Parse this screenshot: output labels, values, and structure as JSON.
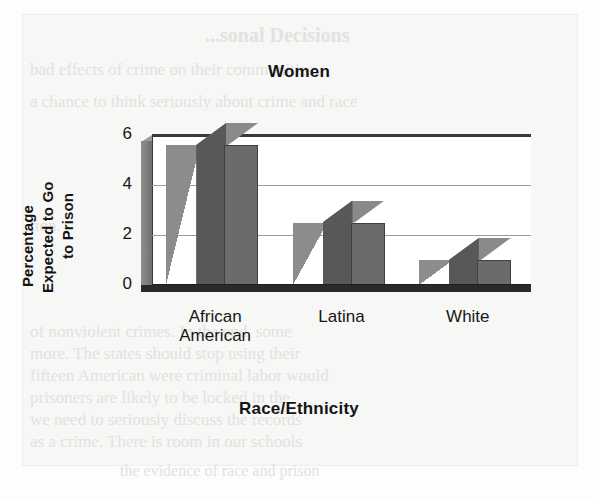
{
  "page": {
    "background_color": "#fdfdfd",
    "panel_color": "#f7f7f5",
    "ghost_lines": [
      {
        "text": "...sonal Decisions",
        "x": 205,
        "y": 24,
        "size": 20,
        "bold": true
      },
      {
        "text": "bad effects of crime on their communities",
        "x": 30,
        "y": 60,
        "size": 17,
        "bold": false
      },
      {
        "text": "a chance to think seriously about crime and race",
        "x": 30,
        "y": 92,
        "size": 17,
        "bold": false
      },
      {
        "text": "tion.",
        "x": 30,
        "y": 216,
        "size": 17,
        "bold": false
      },
      {
        "text": "of nonviolent crimes. In the end, some",
        "x": 30,
        "y": 322,
        "size": 17,
        "bold": false
      },
      {
        "text": "more. The states should stop using their",
        "x": 30,
        "y": 344,
        "size": 17,
        "bold": false
      },
      {
        "text": "fifteen American were criminal labor would",
        "x": 30,
        "y": 366,
        "size": 17,
        "bold": false
      },
      {
        "text": "prisoners are likely to be locked in the",
        "x": 30,
        "y": 388,
        "size": 17,
        "bold": false
      },
      {
        "text": "we need to seriously discuss the records",
        "x": 30,
        "y": 410,
        "size": 17,
        "bold": false
      },
      {
        "text": "as a crime. There is room in our schools",
        "x": 30,
        "y": 432,
        "size": 17,
        "bold": false
      },
      {
        "text": "the evidence of race and prison",
        "x": 120,
        "y": 462,
        "size": 16,
        "bold": false
      }
    ]
  },
  "chart_data": {
    "type": "bar",
    "title": "Women",
    "subtitle": "",
    "xlabel": "Race/Ethnicity",
    "ylabel": "Percentage Expected to Go to Prison",
    "ylabel_lines": [
      "Percentage",
      "Expected to Go",
      "to Prison"
    ],
    "categories": [
      "African American",
      "Latina",
      "White"
    ],
    "category_lines": [
      [
        "African",
        "American"
      ],
      [
        "Latina"
      ],
      [
        "White"
      ]
    ],
    "values": [
      5.6,
      2.5,
      1.0
    ],
    "ylim": [
      0,
      6
    ],
    "yticks": [
      0,
      2,
      4,
      6
    ],
    "ytick_labels": [
      "0",
      "2",
      "4",
      "6"
    ],
    "grid": true,
    "legend": "none",
    "style": "3d-bars",
    "bar_color": "#6b6b6b",
    "bar_side_color": "#585858",
    "bar_top_color": "#8a8a8a",
    "shadow_color": "#8c8c8c",
    "gridline_color": "#9b9b9b",
    "axis_color": "#2a2a2a",
    "plot_background": "#ffffff"
  }
}
